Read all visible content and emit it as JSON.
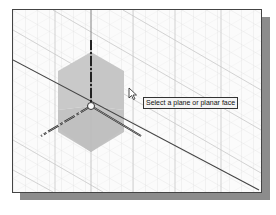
{
  "viewport": {
    "label": "3D graphics viewport",
    "background_color": "#fbfbfb",
    "grid_color": "#d8d8d8",
    "plane_fill_color": "#c4c4c4",
    "axis_color": "#333333",
    "shadow_color": "#8c8c8c"
  },
  "tooltip": {
    "text": "Select a plane or planar face"
  },
  "icons": {
    "cursor": "arrow-cursor-icon",
    "origin": "origin-point-icon",
    "triad": "axis-triad-icon"
  }
}
